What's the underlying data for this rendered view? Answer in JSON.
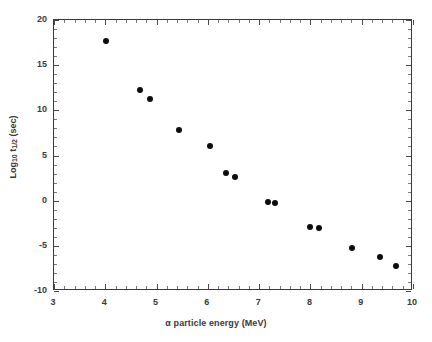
{
  "chart_data": {
    "type": "scatter",
    "title": "",
    "xlabel": "α particle energy (MeV)",
    "ylabel": "Log10 t1/2 (sec)",
    "ylabel_parts": {
      "prefix": "Log",
      "sub1": "10",
      "mid": " t",
      "sub2": "1/2",
      "suffix": " (sec)"
    },
    "xlim": [
      3,
      10
    ],
    "ylim": [
      -10,
      20
    ],
    "xticks": [
      3,
      4,
      5,
      6,
      7,
      8,
      9,
      10
    ],
    "xtick_labels": [
      "3",
      "4",
      "5",
      "6",
      "7",
      "8",
      "9",
      "10"
    ],
    "yticks": [
      -10,
      -5,
      0,
      5,
      10,
      15,
      20
    ],
    "ytick_labels": [
      "-10",
      "-5",
      "0",
      "5",
      "10",
      "15",
      "20"
    ],
    "x_minor_per_major": 5,
    "y_minor_per_major": 5,
    "grid": false,
    "legend": null,
    "marker": {
      "shape": "circle",
      "color": "#0d0d0d",
      "size_px": 6
    },
    "series": [
      {
        "name": "alpha emitters",
        "points": [
          {
            "x": 4.02,
            "y": 17.7
          },
          {
            "x": 4.68,
            "y": 12.3
          },
          {
            "x": 4.88,
            "y": 11.3
          },
          {
            "x": 5.43,
            "y": 7.8
          },
          {
            "x": 6.04,
            "y": 6.1
          },
          {
            "x": 6.35,
            "y": 3.1
          },
          {
            "x": 6.52,
            "y": 2.6
          },
          {
            "x": 7.18,
            "y": -0.1
          },
          {
            "x": 7.31,
            "y": -0.3
          },
          {
            "x": 7.99,
            "y": -2.9
          },
          {
            "x": 8.16,
            "y": -3.0
          },
          {
            "x": 8.81,
            "y": -5.2
          },
          {
            "x": 9.35,
            "y": -6.2
          },
          {
            "x": 9.67,
            "y": -7.2
          }
        ]
      }
    ]
  },
  "colors": {
    "marker": "#0d0d0d",
    "axis": "#3a3a3a",
    "background": "#ffffff",
    "text": "#3a3a3a"
  }
}
